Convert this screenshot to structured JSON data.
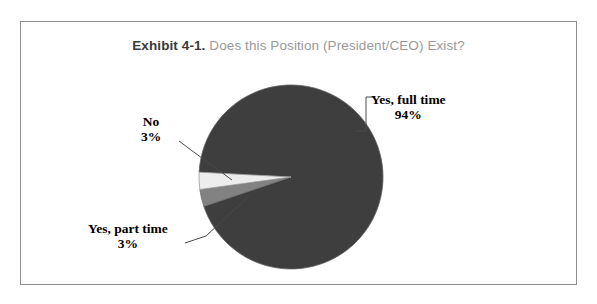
{
  "figure": {
    "title_prefix": "Exhibit 4-1.",
    "title_rest": "Does this Position (President/CEO) Exist?",
    "border_color": "#8d8d8d",
    "background": "#ffffff"
  },
  "labels": {
    "full_time": {
      "name": "Yes, full time",
      "percent": "94%"
    },
    "no": {
      "name": "No",
      "percent": "3%"
    },
    "part_time": {
      "name": "Yes, part time",
      "percent": "3%"
    }
  },
  "chart_data": {
    "type": "pie",
    "categories": [
      "Yes, full time",
      "No",
      "Yes, part time"
    ],
    "values": [
      94,
      3,
      3
    ],
    "value_labels": [
      "94%",
      "3%",
      "3%"
    ],
    "unit": "percent",
    "colors": [
      "#3e3e3e",
      "#828282",
      "#ededed"
    ],
    "slice_edge_color": "#6a6a6a",
    "legend": "none",
    "labels_position": "outside-with-leader-lines",
    "start_angle_deg": 183,
    "direction": "clockwise",
    "center": {
      "x": 291,
      "y": 177
    },
    "radius": 92,
    "grid": false,
    "xlabel": "",
    "ylabel": ""
  }
}
